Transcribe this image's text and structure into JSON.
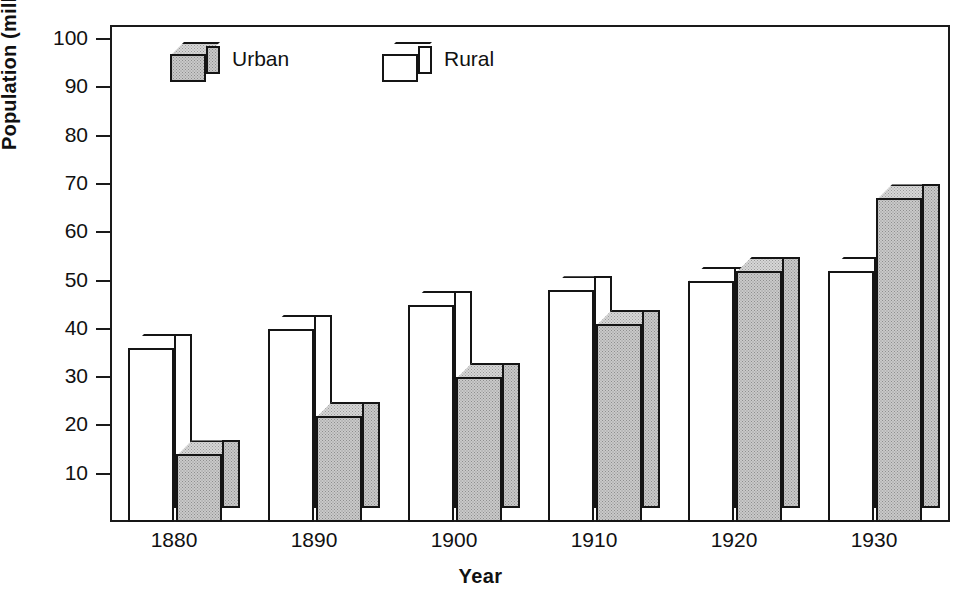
{
  "chart_data": {
    "type": "bar",
    "title": "",
    "xlabel": "Year",
    "ylabel": "Population (millions)",
    "categories": [
      "1880",
      "1890",
      "1900",
      "1910",
      "1920",
      "1930"
    ],
    "series": [
      {
        "name": "Urban",
        "color": "#c9c9c9",
        "values": [
          14,
          22,
          30,
          41,
          52,
          67
        ]
      },
      {
        "name": "Rural",
        "color": "#ffffff",
        "values": [
          36,
          40,
          45,
          48,
          50,
          52
        ]
      }
    ],
    "ylim": [
      0,
      100
    ],
    "yticks": [
      10,
      20,
      30,
      40,
      50,
      60,
      70,
      80,
      90,
      100
    ],
    "ytick_labels": [
      "10",
      "20",
      "30",
      "40",
      "50",
      "60",
      "70",
      "80",
      "90",
      "100"
    ],
    "grid": false,
    "legend_position": "top-left-inside",
    "style": "3d-boxes",
    "series_draw_order": [
      "Rural",
      "Urban"
    ]
  },
  "axes": {
    "y_title": "Population (millions)",
    "x_title": "Year"
  },
  "legend": {
    "items": [
      {
        "label": "Urban",
        "swatch": "gray-cube-icon"
      },
      {
        "label": "Rural",
        "swatch": "white-cube-icon"
      }
    ]
  }
}
